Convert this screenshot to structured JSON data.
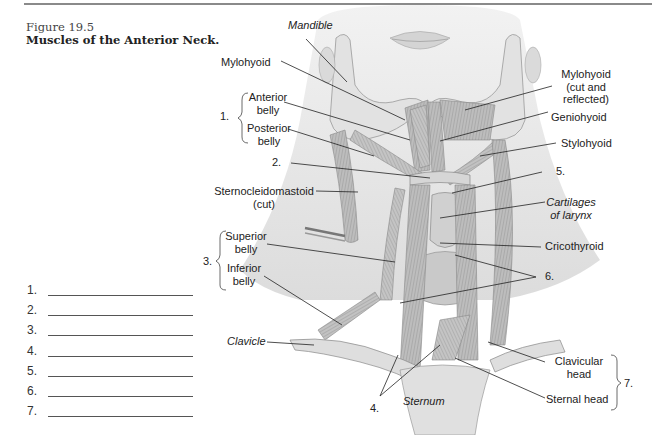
{
  "figure": {
    "number": "Figure 19.5",
    "title": "Muscles of the Anterior Neck."
  },
  "answer_blanks": [
    {
      "num": "1.",
      "value": ""
    },
    {
      "num": "2.",
      "value": ""
    },
    {
      "num": "3.",
      "value": ""
    },
    {
      "num": "4.",
      "value": ""
    },
    {
      "num": "5.",
      "value": ""
    },
    {
      "num": "6.",
      "value": ""
    },
    {
      "num": "7.",
      "value": ""
    }
  ],
  "labels": {
    "mandible": "Mandible",
    "mylohyoid": "Mylohyoid",
    "group1_num": "1.",
    "anterior_belly_1": "Anterior",
    "anterior_belly_2": "belly",
    "posterior_belly_1": "Posterior",
    "posterior_belly_2": "belly",
    "num2": "2.",
    "scm_1": "Sternocleidomastoid",
    "scm_2": "(cut)",
    "group3_num": "3.",
    "superior_belly_1": "Superior",
    "superior_belly_2": "belly",
    "inferior_belly_1": "Inferior",
    "inferior_belly_2": "belly",
    "clavicle": "Clavicle",
    "num4": "4.",
    "sternum": "Sternum",
    "mylohyoid_reflected_1": "Mylohyoid",
    "mylohyoid_reflected_2": "(cut and",
    "mylohyoid_reflected_3": "reflected)",
    "geniohyoid": "Geniohyoid",
    "stylohyoid": "Stylohyoid",
    "num5": "5.",
    "cartilages_1": "Cartilages",
    "cartilages_2": "of larynx",
    "cricothyroid": "Cricothyroid",
    "num6": "6.",
    "clavicular_head_1": "Clavicular",
    "clavicular_head_2": "head",
    "sternal_head": "Sternal head",
    "group7_num": "7."
  },
  "colors": {
    "line": "#222222",
    "skin": "#e6e6e6",
    "muscle": "#b5b5b5",
    "bone": "#d9d9d9"
  }
}
